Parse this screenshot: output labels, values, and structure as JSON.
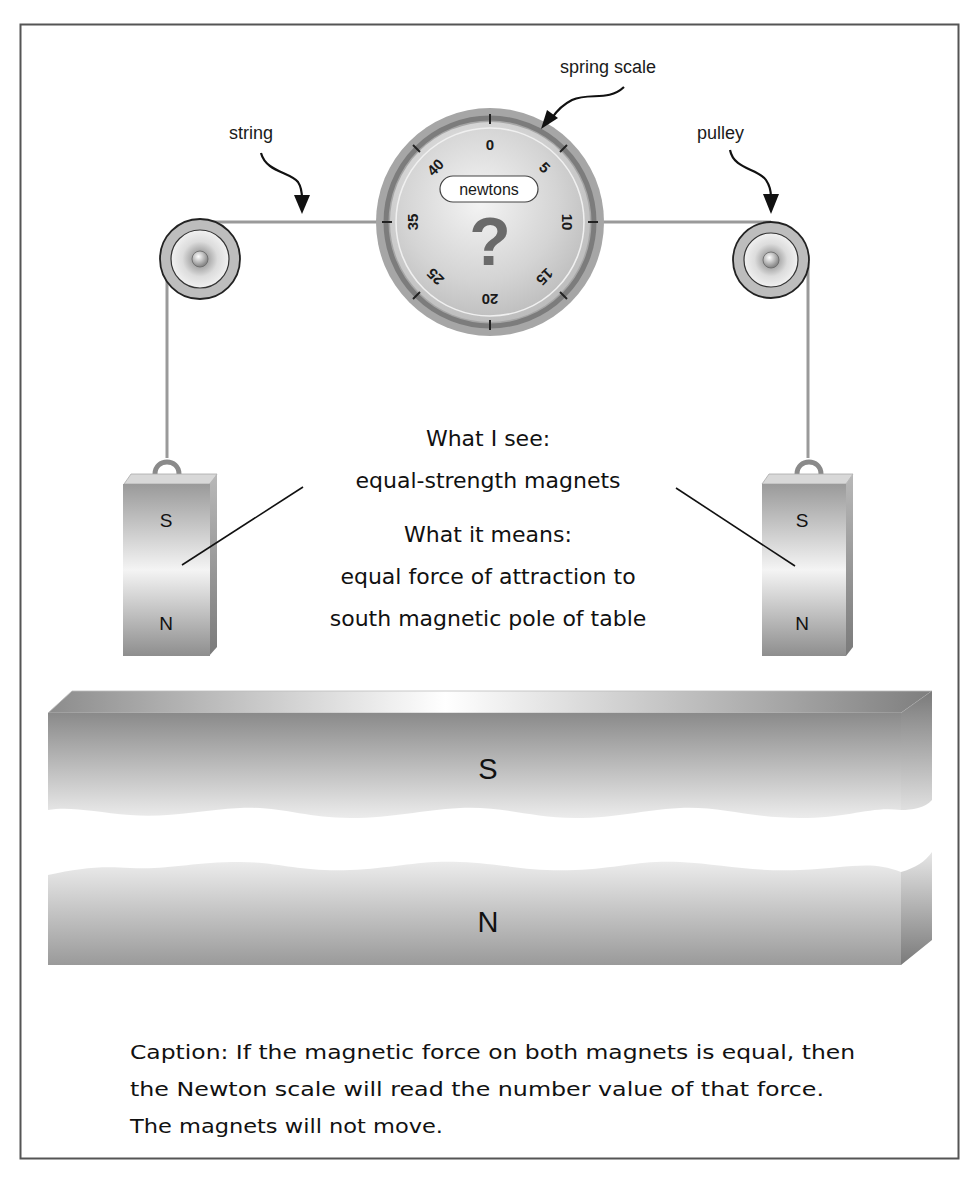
{
  "labels": {
    "spring_scale": "spring scale",
    "string": "string",
    "pulley": "pulley"
  },
  "spring_scale": {
    "unit": "newtons",
    "reading": "?",
    "ticks": [
      "0",
      "5",
      "10",
      "15",
      "20",
      "25",
      "35",
      "40"
    ]
  },
  "hanging_magnets": {
    "left": {
      "top_pole": "S",
      "bottom_pole": "N"
    },
    "right": {
      "top_pole": "S",
      "bottom_pole": "N"
    }
  },
  "annotation": {
    "see_heading": "What I see:",
    "see_text": "equal-strength magnets",
    "means_heading": "What it means:",
    "means_line1": "equal force of attraction to",
    "means_line2": "south magnetic pole of table"
  },
  "table_magnet": {
    "top_pole": "S",
    "bottom_pole": "N"
  },
  "caption": {
    "line1": "Caption: If the magnetic force on both magnets is equal, then",
    "line2": "the Newton scale will read the number value of that force.",
    "line3": "The magnets will not move."
  },
  "colors": {
    "frame": "#555555",
    "string": "#9a9a9a",
    "dial_rim": "#9b9b9b",
    "dial_face": "#d6d6d6",
    "question_mark": "#6a6a6a",
    "magnet_dark": "#8a8a8a",
    "magnet_light": "#f2f2f2"
  }
}
